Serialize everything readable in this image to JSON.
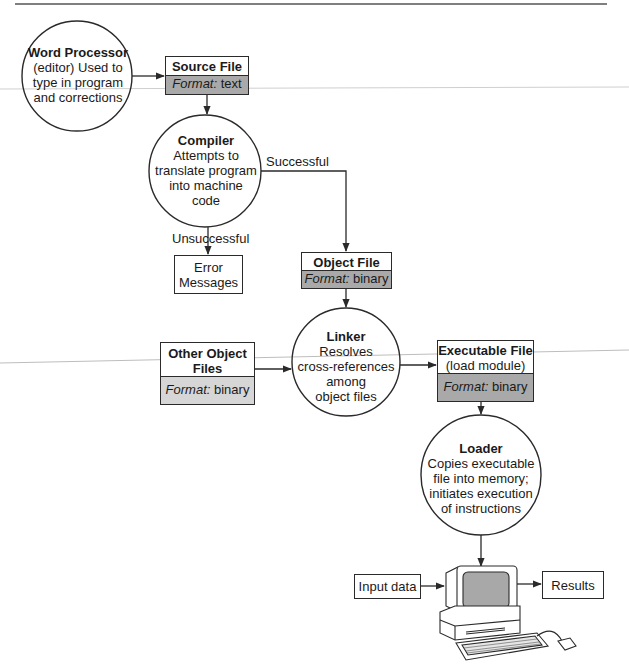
{
  "colors": {
    "line": "#2a2a2a",
    "format_fill_dark": "#a9a9a9",
    "format_fill_light": "#d6d6d6",
    "screen_fill": "#a8a8a8"
  },
  "nodes": {
    "word_processor": {
      "title": "Word Processor",
      "lines": [
        "(editor) Used to",
        "type in program",
        "and corrections"
      ]
    },
    "source_file": {
      "title": "Source File",
      "format_label": "Format:",
      "format_value": "text"
    },
    "compiler": {
      "title": "Compiler",
      "lines": [
        "Attempts to",
        "translate program",
        "into machine",
        "code"
      ]
    },
    "error_messages": {
      "lines": [
        "Error",
        "Messages"
      ]
    },
    "object_file": {
      "title": "Object File",
      "format_label": "Format:",
      "format_value": "binary"
    },
    "other_object_files": {
      "title_lines": [
        "Other Object",
        "Files"
      ],
      "format_label": "Format:",
      "format_value": "binary"
    },
    "linker": {
      "title": "Linker",
      "lines": [
        "Resolves",
        "cross-references",
        "among",
        "object files"
      ]
    },
    "executable_file": {
      "title": "Executable File",
      "subtitle": "(load module)",
      "format_label": "Format:",
      "format_value": "binary"
    },
    "loader": {
      "title": "Loader",
      "lines": [
        "Copies executable",
        "file into memory;",
        "initiates execution",
        "of instructions"
      ]
    },
    "input_data": {
      "label": "Input data"
    },
    "results": {
      "label": "Results"
    }
  },
  "edges": {
    "successful": "Successful",
    "unsuccessful": "Unsuccessful"
  }
}
